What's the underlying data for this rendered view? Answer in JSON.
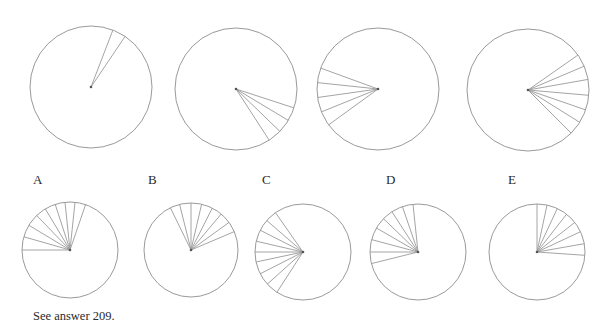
{
  "puzzle": {
    "stroke_color": "#9a9a9a",
    "top_row": [
      {
        "id": "top-1",
        "cx": 91,
        "cy": 87,
        "r": 61,
        "spoke_angles": [
          21,
          34
        ]
      },
      {
        "id": "top-2",
        "cx": 236,
        "cy": 89,
        "r": 61,
        "spoke_angles": [
          108,
          121,
          134,
          147
        ]
      },
      {
        "id": "top-3",
        "cx": 378,
        "cy": 89,
        "r": 61,
        "spoke_angles": [
          234,
          248,
          262,
          276,
          290
        ]
      },
      {
        "id": "top-4",
        "cx": 528,
        "cy": 90,
        "r": 61,
        "spoke_angles": [
          55,
          67,
          80,
          95,
          109,
          122,
          135
        ]
      }
    ],
    "option_labels": [
      {
        "text": "A",
        "x": 33,
        "y": 172
      },
      {
        "text": "B",
        "x": 148,
        "y": 172
      },
      {
        "text": "C",
        "x": 262,
        "y": 172
      },
      {
        "text": "D",
        "x": 386,
        "y": 172
      },
      {
        "text": "E",
        "x": 508,
        "y": 172
      }
    ],
    "options": [
      {
        "id": "option-A",
        "label": "A",
        "cx": 70,
        "cy": 250,
        "r": 48,
        "spoke_angles": [
          270,
          286,
          301,
          316,
          329,
          342,
          354,
          6,
          19
        ]
      },
      {
        "id": "option-B",
        "label": "B",
        "cx": 191,
        "cy": 250,
        "r": 47,
        "spoke_angles": [
          334,
          346,
          0,
          13,
          27,
          40,
          54,
          67
        ]
      },
      {
        "id": "option-C",
        "label": "C",
        "cx": 303,
        "cy": 252,
        "r": 48,
        "spoke_angles": [
          213,
          228,
          243,
          258,
          270,
          283,
          297,
          311,
          325
        ]
      },
      {
        "id": "option-D",
        "label": "D",
        "cx": 418,
        "cy": 252,
        "r": 48,
        "spoke_angles": [
          354,
          341,
          327,
          314,
          300,
          285,
          270,
          256
        ]
      },
      {
        "id": "option-E",
        "label": "E",
        "cx": 537,
        "cy": 252,
        "r": 48,
        "spoke_angles": [
          0,
          12,
          25,
          38,
          52,
          65,
          80,
          94
        ]
      }
    ],
    "caption": "See answer 209."
  }
}
